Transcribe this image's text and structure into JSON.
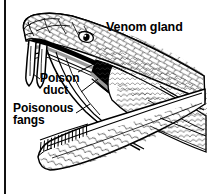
{
  "figure": {
    "background_color": "#ffffff",
    "ink_color": "#000000",
    "labels": {
      "venom_gland": "Venom gland",
      "poison": "Poison",
      "duct": "duct",
      "poisonous": "Poisonous",
      "fangs": "fangs"
    },
    "parts": [
      "venom-gland",
      "poison-duct",
      "poisonous-fangs",
      "upper-jaw",
      "lower-jaw",
      "eye",
      "teeth",
      "scales"
    ],
    "rule": {
      "orientation": "vertical",
      "color": "#111111"
    }
  }
}
